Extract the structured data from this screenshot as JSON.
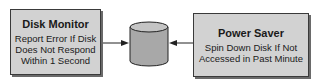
{
  "diagram": {
    "left_box": {
      "title": "Disk Monitor",
      "lines": [
        "Report Error If Disk",
        "Does Not Respond",
        "Within 1 Second"
      ]
    },
    "center": {
      "icon": "disk-cylinder-icon"
    },
    "right_box": {
      "title": "Power Saver",
      "lines": [
        "Spin Down Disk If Not",
        "Accessed in Past Minute"
      ]
    },
    "colors": {
      "box_fill": "#d2d2d2",
      "border": "#3a3a3a",
      "cylinder_fill": "#a8a8a8",
      "cylinder_top": "#c4c4c4"
    }
  }
}
